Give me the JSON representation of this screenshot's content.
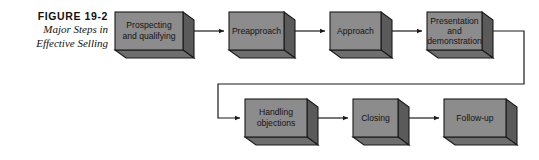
{
  "figure": {
    "label": "FIGURE  19-2",
    "title_lines": [
      "Major Steps in",
      "Effective Selling"
    ]
  },
  "colors": {
    "box_front": "#8c8c8c",
    "box_side": "#5a5a5a",
    "box_bottom": "#6e6e6e",
    "outline": "#1a1a1a",
    "arrow": "#1a1a1a",
    "text": "#141414",
    "background": "#ffffff"
  },
  "diagram": {
    "type": "flowchart",
    "orientation": "two-row-serpentine",
    "nodes": [
      {
        "id": "prospecting",
        "lines": [
          "Prospecting",
          "and qualifying"
        ],
        "row": 1,
        "order": 1
      },
      {
        "id": "preapproach",
        "lines": [
          "Preapproach"
        ],
        "row": 1,
        "order": 2
      },
      {
        "id": "approach",
        "lines": [
          "Approach"
        ],
        "row": 1,
        "order": 3
      },
      {
        "id": "presentation",
        "lines": [
          "Presentation",
          "and",
          "demonstration"
        ],
        "row": 1,
        "order": 4
      },
      {
        "id": "handling",
        "lines": [
          "Handling",
          "objections"
        ],
        "row": 2,
        "order": 5
      },
      {
        "id": "closing",
        "lines": [
          "Closing"
        ],
        "row": 2,
        "order": 6
      },
      {
        "id": "followup",
        "lines": [
          "Follow-up"
        ],
        "row": 2,
        "order": 7
      }
    ],
    "edges": [
      {
        "from": "prospecting",
        "to": "preapproach",
        "kind": "straight"
      },
      {
        "from": "preapproach",
        "to": "approach",
        "kind": "straight"
      },
      {
        "from": "approach",
        "to": "presentation",
        "kind": "straight"
      },
      {
        "from": "presentation",
        "to": "handling",
        "kind": "wrap-around"
      },
      {
        "from": "handling",
        "to": "closing",
        "kind": "straight"
      },
      {
        "from": "closing",
        "to": "followup",
        "kind": "straight"
      }
    ]
  }
}
